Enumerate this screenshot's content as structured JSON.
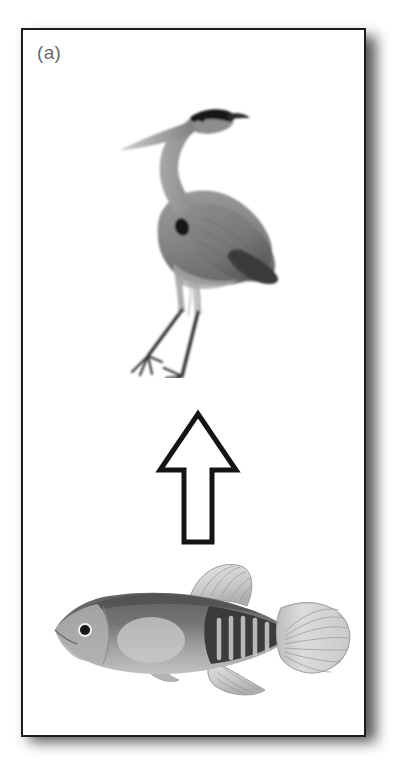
{
  "figure": {
    "panel_label": "(a)",
    "background_color": "#ffffff",
    "panel_border_color": "#1c1c1c",
    "label_color": "#6a6a6a",
    "shadow_color": "#2b2b2b"
  },
  "content": {
    "items": [
      {
        "id": "heron",
        "name": "great-blue-heron",
        "role": "predator",
        "description": "Grayscale illustration of a standing great blue heron in profile, facing left, with long pointed beak, dark crown stripe, S-curved neck, dark breast spot, folded gray wings and long thin legs with splayed toes.",
        "tone_light": "#b9b9b9",
        "tone_mid": "#8d8d8d",
        "tone_dark": "#565656",
        "tone_darkest": "#1f1f1f"
      },
      {
        "id": "arrow",
        "name": "upward-arrow",
        "role": "direction-of-effect",
        "direction": "up",
        "description": "Outlined upward-pointing arrow, white fill with black outline, indicating the fish is consumed by / influences the heron.",
        "outline_color": "#141414",
        "fill_color": "#ffffff"
      },
      {
        "id": "fish",
        "name": "killifish",
        "role": "prey",
        "description": "Grayscale illustration of a small killifish in profile facing left, with pale rounded dorsal and anal fins, dark caudal peduncle bearing pale vertical bars, and a large pale fan-shaped caudal fin.",
        "tone_light": "#d6d6d6",
        "tone_mid": "#9a9a9a",
        "tone_dark": "#5f5f5f",
        "tone_darkest": "#2e2e2e"
      }
    ]
  }
}
